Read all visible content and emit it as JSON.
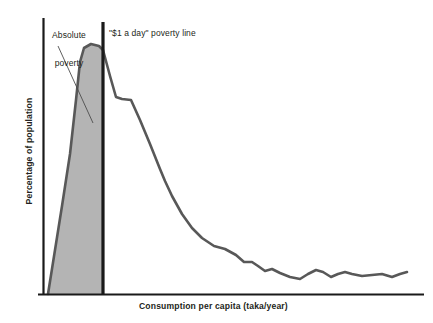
{
  "chart_data": {
    "type": "area",
    "title": "",
    "subtitle": "",
    "xlabel": "Consumption per capita (taka/year)",
    "ylabel": "Percentage of population",
    "grid": false,
    "legend": null,
    "axis_ticks": {
      "x": [],
      "y": []
    },
    "xlim": [
      0,
      100
    ],
    "ylim": [
      0,
      100
    ],
    "annotations": [
      {
        "name": "absolute-poverty",
        "text": "Absolute\npoverty",
        "line1": "Absolute",
        "line2": "poverty",
        "leader_line": {
          "x1": 58,
          "y1": 46,
          "x2": 93,
          "y2": 123
        }
      },
      {
        "name": "dollar-a-day-poverty-line",
        "text": "\"$1 a day\" poverty line"
      }
    ],
    "vertical_markers": [
      {
        "name": "dollar-a-day-poverty-line",
        "label": "\"$1 a day\" poverty line",
        "x_px": 103,
        "color": "#1a1a1a"
      }
    ],
    "shaded_region": {
      "name": "absolute-poverty-area",
      "fill": "#b4b4b4",
      "from_x_px": 48,
      "to_x_px": 103
    },
    "series": [
      {
        "name": "distribution of population by consumption per capita",
        "stroke": "#585858",
        "points_px": [
          [
            48,
            294
          ],
          [
            62,
            206
          ],
          [
            70,
            154
          ],
          [
            76,
            100
          ],
          [
            80,
            62
          ],
          [
            84,
            48
          ],
          [
            91,
            44
          ],
          [
            99,
            46
          ],
          [
            103,
            50
          ],
          [
            110,
            76
          ],
          [
            116,
            97
          ],
          [
            122,
            99
          ],
          [
            131,
            100
          ],
          [
            140,
            120
          ],
          [
            150,
            144
          ],
          [
            160,
            169
          ],
          [
            165,
            181
          ],
          [
            172,
            196
          ],
          [
            182,
            214
          ],
          [
            192,
            228
          ],
          [
            202,
            238
          ],
          [
            214,
            246
          ],
          [
            225,
            249
          ],
          [
            236,
            255
          ],
          [
            244,
            262
          ],
          [
            252,
            262
          ],
          [
            258,
            266
          ],
          [
            265,
            271
          ],
          [
            272,
            269
          ],
          [
            280,
            273
          ],
          [
            290,
            277
          ],
          [
            300,
            279
          ],
          [
            308,
            274
          ],
          [
            316,
            270
          ],
          [
            323,
            272
          ],
          [
            331,
            277
          ],
          [
            338,
            274
          ],
          [
            345,
            272
          ],
          [
            352,
            274
          ],
          [
            362,
            276
          ],
          [
            372,
            275
          ],
          [
            382,
            274
          ],
          [
            392,
            277
          ],
          [
            400,
            274
          ],
          [
            407,
            272
          ]
        ]
      }
    ],
    "axes": {
      "y_axis_px": {
        "x": 43,
        "y_top": 18,
        "y_bottom": 294
      },
      "x_axis_px": {
        "y": 294,
        "x_left": 38,
        "x_right": 424
      },
      "color": "#1a1a1a"
    }
  },
  "colors": {
    "background": "#ffffff",
    "axis": "#1a1a1a",
    "curve": "#585858",
    "shade": "#b4b4b4",
    "poverty_line": "#1a1a1a",
    "text": "#231f20"
  }
}
